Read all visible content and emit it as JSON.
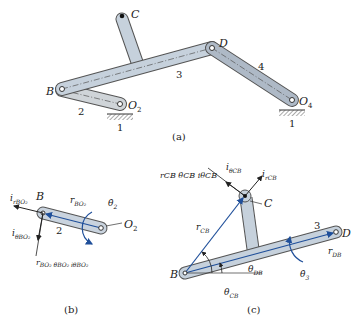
{
  "panel_a": {
    "caption": "(a)",
    "points": {
      "C": "C",
      "B": "B",
      "D": "D",
      "O2": "O",
      "O2_sub": "2",
      "O4": "O",
      "O4_sub": "4"
    },
    "links": {
      "link2": "2",
      "link3": "3",
      "link4": "4",
      "ground_left": "1",
      "ground_right": "1"
    }
  },
  "panel_b": {
    "caption": "(b)",
    "labels": {
      "B": "B",
      "O2": "O",
      "O2_sub": "2",
      "link": "2",
      "i_r": "i",
      "i_r_sub": "rBO₂",
      "i_theta": "i",
      "i_theta_sub": "θBO₂",
      "r_vec": "r",
      "r_vec_sub": "BO₂",
      "theta_dot": "θ̇",
      "theta_dot_sub": "2",
      "tangential": "r",
      "tangential_text": "BO₂ θ̇BO₂ iθBO₂"
    },
    "colors": {
      "link_fill": "#c9d3de",
      "vector": "#1f4f9a"
    }
  },
  "panel_c": {
    "caption": "(c)",
    "labels": {
      "B": "B",
      "C": "C",
      "D": "D",
      "link": "3",
      "r_CB": "r",
      "r_CB_sub": "CB",
      "r_DB": "r",
      "r_DB_sub": "DB",
      "theta_DB": "θ",
      "theta_DB_sub": "DB",
      "theta_CB": "θ",
      "theta_CB_sub": "CB",
      "theta3_dot": "θ̇",
      "theta3_sub": "3",
      "i_rCB": "i",
      "i_rCB_sub": "rCB",
      "i_thetaCB": "i",
      "i_thetaCB_sub": "θCB",
      "tangential_text": "rCB θ̇CB iθCB"
    }
  }
}
